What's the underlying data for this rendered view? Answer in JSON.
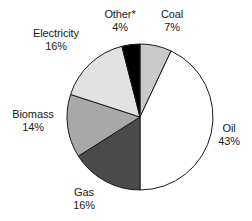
{
  "chart_data": {
    "type": "pie",
    "title": "",
    "subtitle": "",
    "xlabel": "",
    "ylabel": "",
    "legend_position": "none",
    "grid": false,
    "units": "percent",
    "start_angle_deg": 0,
    "direction": "clockwise",
    "categories": [
      "Coal",
      "Oil",
      "Gas",
      "Biomass",
      "Electricity",
      "Other*"
    ],
    "values": [
      7,
      43,
      16,
      14,
      16,
      4
    ],
    "slices": [
      {
        "label": "Coal",
        "value": 7,
        "value_text": "7%",
        "color": "#c9c9c9",
        "stroke": "#1a1a1a",
        "start_deg": 0,
        "end_deg": 25.2
      },
      {
        "label": "Oil",
        "value": 43,
        "value_text": "43%",
        "color": "#ffffff",
        "stroke": "#1a1a1a",
        "start_deg": 25.2,
        "end_deg": 180.0
      },
      {
        "label": "Gas",
        "value": 16,
        "value_text": "16%",
        "color": "#4a4a4a",
        "stroke": "#1a1a1a",
        "start_deg": 180.0,
        "end_deg": 237.6
      },
      {
        "label": "Biomass",
        "value": 14,
        "value_text": "14%",
        "color": "#a8a8a8",
        "stroke": "#1a1a1a",
        "start_deg": 237.6,
        "end_deg": 288.0
      },
      {
        "label": "Electricity",
        "value": 16,
        "value_text": "16%",
        "color": "#e2e2e2",
        "stroke": "#1a1a1a",
        "start_deg": 288.0,
        "end_deg": 345.6
      },
      {
        "label": "Other*",
        "value": 4,
        "value_text": "4%",
        "color": "#000000",
        "stroke": "#1a1a1a",
        "start_deg": 345.6,
        "end_deg": 360.0
      }
    ]
  },
  "labels": {
    "other": {
      "name": "Other*",
      "value": "4%"
    },
    "coal": {
      "name": "Coal",
      "value": "7%"
    },
    "electricity": {
      "name": "Electricity",
      "value": "16%"
    },
    "biomass": {
      "name": "Biomass",
      "value": "14%"
    },
    "gas": {
      "name": "Gas",
      "value": "16%"
    },
    "oil": {
      "name": "Oil",
      "value": "43%"
    }
  },
  "colors": {
    "outline": "#1a1a1a",
    "text": "#1a1a1a",
    "background": "#ffffff"
  },
  "geometry": {
    "center_x": 140,
    "center_y": 117,
    "radius": 73
  }
}
